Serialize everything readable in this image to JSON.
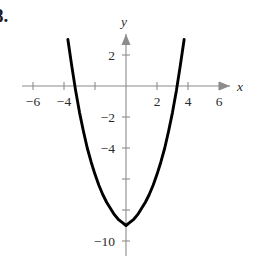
{
  "figure": {
    "problem_number": "8.",
    "background_color": "#ffffff",
    "curve_color": "#000000",
    "axis_color": "#8c8c8c",
    "label_color": "#2b2b2b"
  },
  "chart_data": {
    "type": "line",
    "title": "",
    "subtitle": "",
    "xlabel": "x",
    "ylabel": "y",
    "xlim": [
      -7.5,
      7.8
    ],
    "ylim": [
      -11.2,
      3.6
    ],
    "grid": false,
    "legend": null,
    "axes_style": "arrow-terminated cartesian axes through origin",
    "x_ticks": [
      -6,
      -4,
      -2,
      2,
      4,
      6
    ],
    "x_tick_labels": [
      "-6",
      "-4",
      "",
      "2",
      "4",
      "6"
    ],
    "y_ticks": [
      2,
      -2,
      -4,
      -6,
      -8,
      -10
    ],
    "y_tick_labels": [
      "2",
      "-2",
      "-4",
      "",
      "",
      "-10"
    ],
    "series": [
      {
        "name": "parabola",
        "kind": "quadratic",
        "equation": "y = x^2 - 9",
        "vertex": [
          0,
          -9
        ],
        "roots": [
          -3.3,
          3.3
        ],
        "y_intercept": -9,
        "opens": "upward",
        "x": [
          -3.75,
          -3.5,
          -3.25,
          -3.0,
          -2.75,
          -2.5,
          -2.25,
          -2.0,
          -1.75,
          -1.5,
          -1.25,
          -1.0,
          -0.75,
          -0.5,
          -0.25,
          0,
          0.25,
          0.5,
          0.75,
          1.0,
          1.25,
          1.5,
          1.75,
          2.0,
          2.25,
          2.5,
          2.75,
          3.0,
          3.25,
          3.5,
          3.75
        ],
        "y": [
          3.0,
          1.3,
          -0.3,
          -1.7,
          -2.9,
          -4.0,
          -4.9,
          -5.7,
          -6.4,
          -7.0,
          -7.5,
          -7.9,
          -8.3,
          -8.6,
          -8.8,
          -9.0,
          -8.8,
          -8.6,
          -8.3,
          -7.9,
          -7.5,
          -7.0,
          -6.4,
          -5.7,
          -4.9,
          -4.0,
          -2.9,
          -1.7,
          -0.3,
          1.3,
          3.0
        ]
      }
    ]
  },
  "labels": {
    "x_axis_name": "x",
    "y_axis_name": "y",
    "x_neg6": "−6",
    "x_neg4": "−4",
    "x_pos2": "2",
    "x_pos4": "4",
    "x_pos6": "6",
    "y_pos2": "2",
    "y_neg2": "−2",
    "y_neg4": "−4",
    "y_neg10": "−10"
  }
}
